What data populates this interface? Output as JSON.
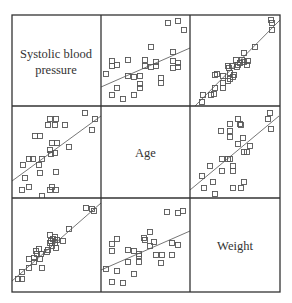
{
  "chart_data": {
    "type": "scatter",
    "subtype": "scatterplot-matrix",
    "title": "",
    "variables": [
      "Systolic blood pressure",
      "Age",
      "Weight"
    ],
    "diagonal_labels": [
      [
        "Systolic blood",
        "pressure"
      ],
      [
        "Age"
      ],
      [
        "Weight"
      ]
    ],
    "grid": false,
    "legend": null,
    "axis_ticks": "none",
    "colors": {
      "border": "#333333",
      "marker": "#555555",
      "line": "#666666",
      "background": "#ffffff"
    },
    "panels": [
      {
        "row": 0,
        "col": 1,
        "y_var": "Systolic blood pressure",
        "x_var": "Age",
        "fit_line": [
          [
            0,
            72
          ],
          [
            89,
            33
          ]
        ],
        "points": [
          [
            67,
            8
          ],
          [
            77,
            6
          ],
          [
            83,
            15
          ],
          [
            50,
            32
          ],
          [
            72,
            37
          ],
          [
            11,
            46
          ],
          [
            16,
            50
          ],
          [
            27,
            45
          ],
          [
            44,
            45
          ],
          [
            11,
            51
          ],
          [
            44,
            51
          ],
          [
            55,
            47
          ],
          [
            50,
            52
          ],
          [
            55,
            51
          ],
          [
            72,
            46
          ],
          [
            77,
            48
          ],
          [
            77,
            52
          ],
          [
            72,
            53
          ],
          [
            5,
            59
          ],
          [
            27,
            61
          ],
          [
            33,
            62
          ],
          [
            39,
            61
          ],
          [
            60,
            63
          ],
          [
            60,
            68
          ],
          [
            39,
            69
          ],
          [
            39,
            73
          ],
          [
            16,
            73
          ],
          [
            11,
            80
          ],
          [
            33,
            80
          ],
          [
            22,
            84
          ]
        ]
      },
      {
        "row": 0,
        "col": 2,
        "y_var": "Systolic blood pressure",
        "x_var": "Weight",
        "fit_line": [
          [
            5,
            91
          ],
          [
            90,
            5
          ]
        ],
        "points": [
          [
            81,
            5
          ],
          [
            82,
            8
          ],
          [
            82,
            15
          ],
          [
            65,
            32
          ],
          [
            54,
            38
          ],
          [
            46,
            45
          ],
          [
            52,
            45
          ],
          [
            54,
            47
          ],
          [
            50,
            48
          ],
          [
            58,
            46
          ],
          [
            57,
            50
          ],
          [
            48,
            50
          ],
          [
            42,
            51
          ],
          [
            38,
            51
          ],
          [
            47,
            52
          ],
          [
            39,
            53
          ],
          [
            40,
            58
          ],
          [
            27,
            59
          ],
          [
            44,
            60
          ],
          [
            43,
            62
          ],
          [
            33,
            61
          ],
          [
            40,
            64
          ],
          [
            38,
            66
          ],
          [
            33,
            68
          ],
          [
            25,
            60
          ],
          [
            25,
            73
          ],
          [
            33,
            73
          ],
          [
            24,
            79
          ],
          [
            13,
            80
          ],
          [
            12,
            87
          ],
          [
            21,
            80
          ]
        ]
      },
      {
        "row": 1,
        "col": 0,
        "y_var": "Age",
        "x_var": "Systolic blood pressure",
        "fit_line": [
          [
            0,
            75
          ],
          [
            89,
            10
          ]
        ],
        "points": [
          [
            73,
            7
          ],
          [
            83,
            13
          ],
          [
            80,
            24
          ],
          [
            38,
            13
          ],
          [
            44,
            13
          ],
          [
            36,
            19
          ],
          [
            43,
            19
          ],
          [
            53,
            19
          ],
          [
            23,
            30
          ],
          [
            28,
            30
          ],
          [
            40,
            37
          ],
          [
            45,
            37
          ],
          [
            38,
            44
          ],
          [
            57,
            41
          ],
          [
            39,
            48
          ],
          [
            43,
            47
          ],
          [
            30,
            53
          ],
          [
            17,
            53
          ],
          [
            21,
            53
          ],
          [
            11,
            59
          ],
          [
            27,
            59
          ],
          [
            28,
            67
          ],
          [
            44,
            66
          ],
          [
            13,
            72
          ],
          [
            17,
            81
          ],
          [
            40,
            81
          ],
          [
            10,
            84
          ],
          [
            38,
            84
          ],
          [
            44,
            84
          ],
          [
            30,
            90
          ]
        ]
      },
      {
        "row": 1,
        "col": 2,
        "y_var": "Age",
        "x_var": "Weight",
        "fit_line": [
          [
            0,
            84
          ],
          [
            89,
            10
          ]
        ],
        "points": [
          [
            80,
            7
          ],
          [
            78,
            13
          ],
          [
            81,
            23
          ],
          [
            48,
            13
          ],
          [
            40,
            18
          ],
          [
            50,
            18
          ],
          [
            51,
            19
          ],
          [
            31,
            25
          ],
          [
            40,
            25
          ],
          [
            40,
            31
          ],
          [
            53,
            32
          ],
          [
            48,
            38
          ],
          [
            60,
            40
          ],
          [
            54,
            46
          ],
          [
            57,
            46
          ],
          [
            32,
            53
          ],
          [
            38,
            53
          ],
          [
            40,
            53
          ],
          [
            20,
            60
          ],
          [
            43,
            60
          ],
          [
            32,
            65
          ],
          [
            43,
            65
          ],
          [
            12,
            70
          ],
          [
            23,
            76
          ],
          [
            54,
            76
          ],
          [
            14,
            82
          ],
          [
            43,
            82
          ],
          [
            51,
            82
          ],
          [
            25,
            88
          ]
        ]
      },
      {
        "row": 2,
        "col": 0,
        "y_var": "Weight",
        "x_var": "Systolic blood pressure",
        "fit_line": [
          [
            0,
            83
          ],
          [
            89,
            5
          ]
        ],
        "points": [
          [
            74,
            10
          ],
          [
            80,
            11
          ],
          [
            82,
            13
          ],
          [
            57,
            31
          ],
          [
            38,
            37
          ],
          [
            43,
            39
          ],
          [
            41,
            41
          ],
          [
            39,
            43
          ],
          [
            45,
            42
          ],
          [
            43,
            45
          ],
          [
            51,
            43
          ],
          [
            38,
            45
          ],
          [
            40,
            48
          ],
          [
            36,
            52
          ],
          [
            44,
            50
          ],
          [
            27,
            51
          ],
          [
            35,
            54
          ],
          [
            25,
            56
          ],
          [
            29,
            56
          ],
          [
            24,
            53
          ],
          [
            22,
            60
          ],
          [
            28,
            61
          ],
          [
            17,
            61
          ],
          [
            22,
            64
          ],
          [
            30,
            70
          ],
          [
            17,
            70
          ],
          [
            10,
            74
          ],
          [
            6,
            81
          ],
          [
            10,
            81
          ]
        ]
      },
      {
        "row": 2,
        "col": 1,
        "y_var": "Weight",
        "x_var": "Age",
        "fit_line": [
          [
            0,
            72
          ],
          [
            89,
            33
          ]
        ],
        "points": [
          [
            66,
            14
          ],
          [
            77,
            15
          ],
          [
            82,
            13
          ],
          [
            49,
            34
          ],
          [
            43,
            40
          ],
          [
            44,
            42
          ],
          [
            53,
            44
          ],
          [
            49,
            48
          ],
          [
            71,
            45
          ],
          [
            77,
            47
          ],
          [
            11,
            46
          ],
          [
            16,
            41
          ],
          [
            11,
            53
          ],
          [
            27,
            52
          ],
          [
            33,
            53
          ],
          [
            38,
            56
          ],
          [
            38,
            58
          ],
          [
            38,
            64
          ],
          [
            27,
            64
          ],
          [
            55,
            57
          ],
          [
            61,
            57
          ],
          [
            71,
            57
          ],
          [
            60,
            65
          ],
          [
            5,
            71
          ],
          [
            16,
            73
          ],
          [
            33,
            76
          ],
          [
            11,
            84
          ],
          [
            22,
            85
          ]
        ]
      }
    ]
  }
}
